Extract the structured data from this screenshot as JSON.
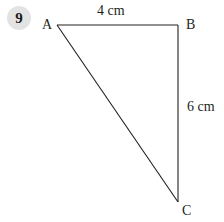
{
  "question": {
    "number": "9",
    "badge_color": "#e3e3e3"
  },
  "figure": {
    "type": "right-triangle",
    "stroke_color": "#231f20",
    "vertices": [
      {
        "label": "A",
        "x": 57,
        "y": 25
      },
      {
        "label": "B",
        "x": 178,
        "y": 25
      },
      {
        "label": "C",
        "x": 178,
        "y": 202
      }
    ],
    "sides": [
      {
        "from": "A",
        "to": "B",
        "label": "4 cm"
      },
      {
        "from": "B",
        "to": "C",
        "label": "6 cm"
      },
      {
        "from": "A",
        "to": "C",
        "label": ""
      }
    ]
  }
}
